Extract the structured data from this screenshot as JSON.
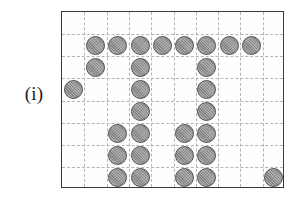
{
  "figure": {
    "label": "(i)",
    "caption_position": "left"
  },
  "board": {
    "columns": 10,
    "rows": 8,
    "cell_size_px": 22.3,
    "origin_x_px": 61,
    "origin_y_px": 11,
    "width_px": 223,
    "height_px": 177,
    "border_color": "#3a3a3a",
    "gridline_color": "#b4b4b4",
    "gridline_style": "dashed",
    "background_color": "#fefefe"
  },
  "stone_style": {
    "fill_color": "#8e8e8e",
    "outline_color": "#565656",
    "shape": "circle",
    "diameter_px": 19,
    "texture": "hatched"
  },
  "chart_data": {
    "type": "heatmap",
    "title": "",
    "xlabel": "",
    "ylabel": "",
    "columns": 10,
    "rows": 8,
    "legend": [],
    "occupancy_grid": [
      [
        0,
        0,
        0,
        0,
        0,
        0,
        0,
        0,
        0,
        0
      ],
      [
        0,
        1,
        1,
        1,
        1,
        1,
        1,
        1,
        1,
        0
      ],
      [
        0,
        1,
        0,
        1,
        0,
        0,
        1,
        0,
        0,
        0
      ],
      [
        1,
        0,
        0,
        1,
        0,
        0,
        1,
        0,
        0,
        0
      ],
      [
        0,
        0,
        0,
        1,
        0,
        0,
        1,
        0,
        0,
        0
      ],
      [
        0,
        0,
        1,
        1,
        0,
        1,
        1,
        0,
        0,
        0
      ],
      [
        0,
        0,
        1,
        1,
        0,
        1,
        1,
        0,
        0,
        0
      ],
      [
        0,
        0,
        1,
        1,
        0,
        1,
        1,
        0,
        0,
        1
      ]
    ],
    "stones": [
      {
        "row": 1,
        "col": 1
      },
      {
        "row": 1,
        "col": 2
      },
      {
        "row": 1,
        "col": 3
      },
      {
        "row": 1,
        "col": 4
      },
      {
        "row": 1,
        "col": 5
      },
      {
        "row": 1,
        "col": 6
      },
      {
        "row": 1,
        "col": 7
      },
      {
        "row": 1,
        "col": 8
      },
      {
        "row": 2,
        "col": 1
      },
      {
        "row": 2,
        "col": 3
      },
      {
        "row": 2,
        "col": 6
      },
      {
        "row": 3,
        "col": 0
      },
      {
        "row": 3,
        "col": 3
      },
      {
        "row": 3,
        "col": 6
      },
      {
        "row": 4,
        "col": 3
      },
      {
        "row": 4,
        "col": 6
      },
      {
        "row": 5,
        "col": 2
      },
      {
        "row": 5,
        "col": 3
      },
      {
        "row": 5,
        "col": 5
      },
      {
        "row": 5,
        "col": 6
      },
      {
        "row": 6,
        "col": 2
      },
      {
        "row": 6,
        "col": 3
      },
      {
        "row": 6,
        "col": 5
      },
      {
        "row": 6,
        "col": 6
      },
      {
        "row": 7,
        "col": 2
      },
      {
        "row": 7,
        "col": 3
      },
      {
        "row": 7,
        "col": 5
      },
      {
        "row": 7,
        "col": 6
      },
      {
        "row": 7,
        "col": 9
      }
    ],
    "stone_count": 29
  }
}
